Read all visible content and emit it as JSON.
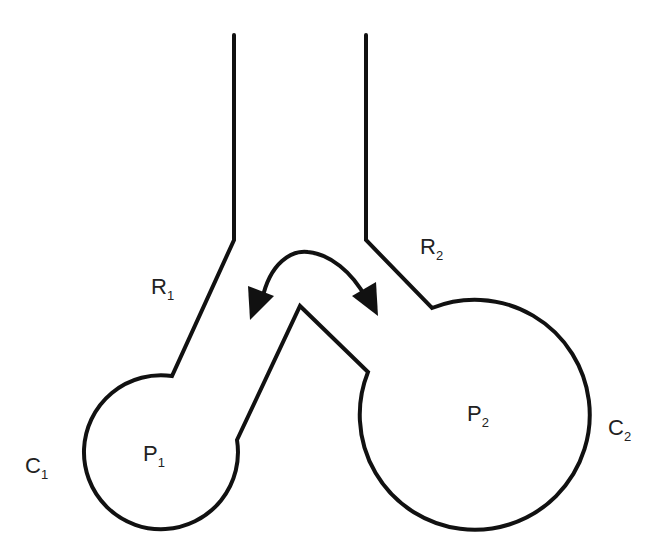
{
  "diagram": {
    "type": "two-compartment lung model",
    "colors": {
      "stroke": "#111111",
      "text": "#222222",
      "background": "#ffffff"
    },
    "labels": {
      "r1": {
        "main": "R",
        "sub": "1"
      },
      "r2": {
        "main": "R",
        "sub": "2"
      },
      "p1": {
        "main": "P",
        "sub": "1"
      },
      "p2": {
        "main": "P",
        "sub": "2"
      },
      "c1": {
        "main": "C",
        "sub": "1"
      },
      "c2": {
        "main": "C",
        "sub": "2"
      }
    },
    "arrow": {
      "kind": "double-headed curved arrow",
      "meaning": "exchange between compartments"
    }
  }
}
